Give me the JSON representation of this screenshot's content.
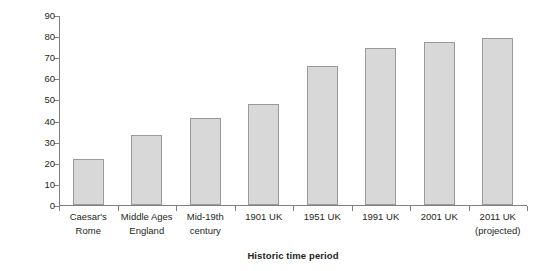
{
  "chart_data": {
    "type": "bar",
    "title": "",
    "xlabel": "Historic time period",
    "ylabel": "Average life span",
    "categories": [
      "Caesar's Rome",
      "Middle Ages England",
      "Mid-19th century",
      "1901 UK",
      "1951 UK",
      "1991 UK",
      "2001 UK",
      "2011 UK (projected)"
    ],
    "category_lines": [
      [
        "Caesar's",
        "Rome"
      ],
      [
        "Middle Ages",
        "England"
      ],
      [
        "Mid-19th",
        "century"
      ],
      [
        "1901 UK"
      ],
      [
        "1951 UK"
      ],
      [
        "1991 UK"
      ],
      [
        "2001 UK"
      ],
      [
        "2011 UK",
        "(projected)"
      ]
    ],
    "values": [
      22,
      33,
      41,
      48,
      66,
      74.5,
      77,
      79
    ],
    "ylim": [
      0,
      90
    ],
    "yticks": [
      0,
      10,
      20,
      30,
      40,
      50,
      60,
      70,
      80,
      90
    ],
    "ytick_labels": [
      "0",
      "10",
      "20",
      "30",
      "40",
      "50",
      "60",
      "70",
      "80",
      "90"
    ],
    "grid": false,
    "legend": "none",
    "bar_fill_color": "#d8d8d8",
    "bar_border_color": "#9a9a9a",
    "axis_color": "#808080",
    "text_color": "#231f20"
  }
}
